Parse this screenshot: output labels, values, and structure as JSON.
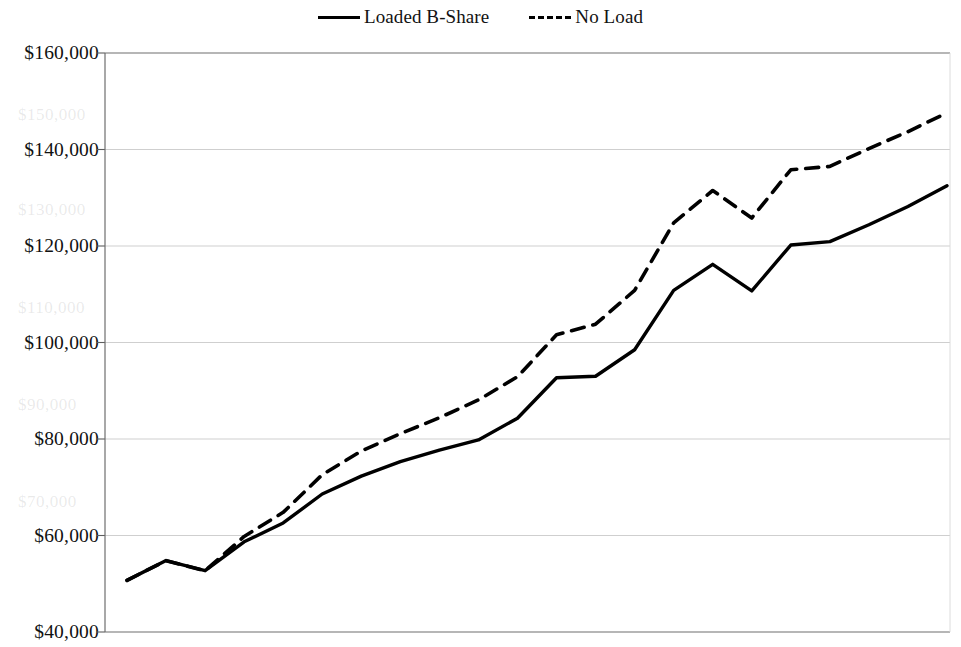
{
  "legend": {
    "position": "top-center",
    "entries": [
      {
        "label": "Loaded B-Share",
        "style": "solid",
        "swatch": "solid-line-swatch"
      },
      {
        "label": "No Load",
        "style": "dashed",
        "swatch": "dashed-line-swatch"
      }
    ]
  },
  "axis": {
    "y_ticks": [
      "$160,000",
      "$140,000",
      "$120,000",
      "$100,000",
      "$80,000",
      "$60,000",
      "$40,000"
    ]
  },
  "ghost_artifacts": [
    "$150,000",
    "$130,000",
    "$110,000",
    "$90,000",
    "$70,000"
  ],
  "chart_data": {
    "type": "line",
    "title": "",
    "subtitle": "",
    "xlabel": "",
    "ylabel": "",
    "ylim": [
      40000,
      160000
    ],
    "ytick_values": [
      40000,
      60000,
      80000,
      100000,
      120000,
      140000,
      160000
    ],
    "ytick_labels": [
      "$40,000",
      "$60,000",
      "$80,000",
      "$100,000",
      "$120,000",
      "$140,000",
      "$160,000"
    ],
    "grid": true,
    "grid_axis": "y",
    "xtick_labels": [],
    "x": [
      1,
      2,
      3,
      4,
      5,
      6,
      7,
      8,
      9,
      10,
      11,
      12,
      13,
      14,
      15,
      16,
      17,
      18,
      19,
      20,
      21,
      22
    ],
    "series": [
      {
        "name": "Loaded B-Share",
        "style": "solid",
        "color": "#000000",
        "values": [
          50700,
          54800,
          52700,
          58700,
          62600,
          68600,
          72300,
          75300,
          77700,
          79800,
          84300,
          92700,
          93000,
          98500,
          110800,
          116200,
          110700,
          120200,
          120900,
          124400,
          128200,
          132500
        ]
      },
      {
        "name": "No Load",
        "style": "dashed",
        "color": "#000000",
        "values": [
          50700,
          54800,
          52700,
          59800,
          64800,
          72600,
          77500,
          81100,
          84400,
          88100,
          92900,
          101600,
          103800,
          110800,
          124800,
          131500,
          125800,
          135800,
          136500,
          140200,
          143700,
          147600
        ]
      }
    ]
  }
}
